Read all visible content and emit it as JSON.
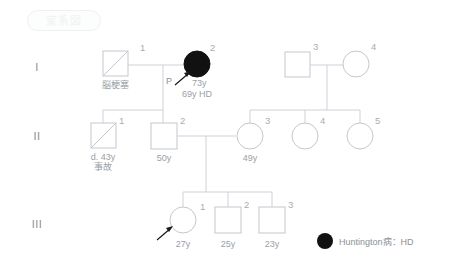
{
  "title_badge": {
    "label": "家系図"
  },
  "generations": [
    {
      "id": "gen-1",
      "label": "I"
    },
    {
      "id": "gen-2",
      "label": "II"
    },
    {
      "id": "gen-3",
      "label": "III"
    }
  ],
  "individuals": [
    {
      "id": "i-1",
      "generation": "I",
      "number": "1",
      "sex": "male",
      "shape": "square",
      "affected": false,
      "deceased": true,
      "caption": "脳梗塞",
      "caption2": ""
    },
    {
      "id": "i-2",
      "generation": "I",
      "number": "2",
      "sex": "female",
      "shape": "circle",
      "affected": true,
      "deceased": false,
      "caption": "73y",
      "caption2": "69y HD",
      "proband": true,
      "proband_letter": "P"
    },
    {
      "id": "i-3",
      "generation": "I",
      "number": "3",
      "sex": "male",
      "shape": "square",
      "affected": false,
      "deceased": false,
      "caption": "",
      "caption2": ""
    },
    {
      "id": "i-4",
      "generation": "I",
      "number": "4",
      "sex": "female",
      "shape": "circle",
      "affected": false,
      "deceased": false,
      "caption": "",
      "caption2": ""
    },
    {
      "id": "ii-1",
      "generation": "II",
      "number": "1",
      "sex": "male",
      "shape": "square",
      "affected": false,
      "deceased": true,
      "caption": "d. 43y",
      "caption2": "事故"
    },
    {
      "id": "ii-2",
      "generation": "II",
      "number": "2",
      "sex": "male",
      "shape": "square",
      "affected": false,
      "deceased": false,
      "caption": "50y",
      "caption2": ""
    },
    {
      "id": "ii-3",
      "generation": "II",
      "number": "3",
      "sex": "female",
      "shape": "circle",
      "affected": false,
      "deceased": false,
      "caption": "49y",
      "caption2": ""
    },
    {
      "id": "ii-4",
      "generation": "II",
      "number": "4",
      "sex": "female",
      "shape": "circle",
      "affected": false,
      "deceased": false,
      "caption": "",
      "caption2": ""
    },
    {
      "id": "ii-5",
      "generation": "II",
      "number": "5",
      "sex": "female",
      "shape": "circle",
      "affected": false,
      "deceased": false,
      "caption": "",
      "caption2": ""
    },
    {
      "id": "iii-1",
      "generation": "III",
      "number": "1",
      "sex": "female",
      "shape": "circle",
      "affected": false,
      "deceased": false,
      "caption": "27y",
      "caption2": "",
      "proband": true,
      "proband_letter": ""
    },
    {
      "id": "iii-2",
      "generation": "III",
      "number": "2",
      "sex": "male",
      "shape": "square",
      "affected": false,
      "deceased": false,
      "caption": "25y",
      "caption2": ""
    },
    {
      "id": "iii-3",
      "generation": "III",
      "number": "3",
      "sex": "male",
      "shape": "square",
      "affected": false,
      "deceased": false,
      "caption": "23y",
      "caption2": ""
    }
  ],
  "legend": {
    "symbol": "filled-circle",
    "text": "Huntington病：HD"
  },
  "colors": {
    "affected_fill": "#111111",
    "line": "#cdd2d7",
    "text": "#9aa0a6",
    "background": "#ffffff"
  }
}
